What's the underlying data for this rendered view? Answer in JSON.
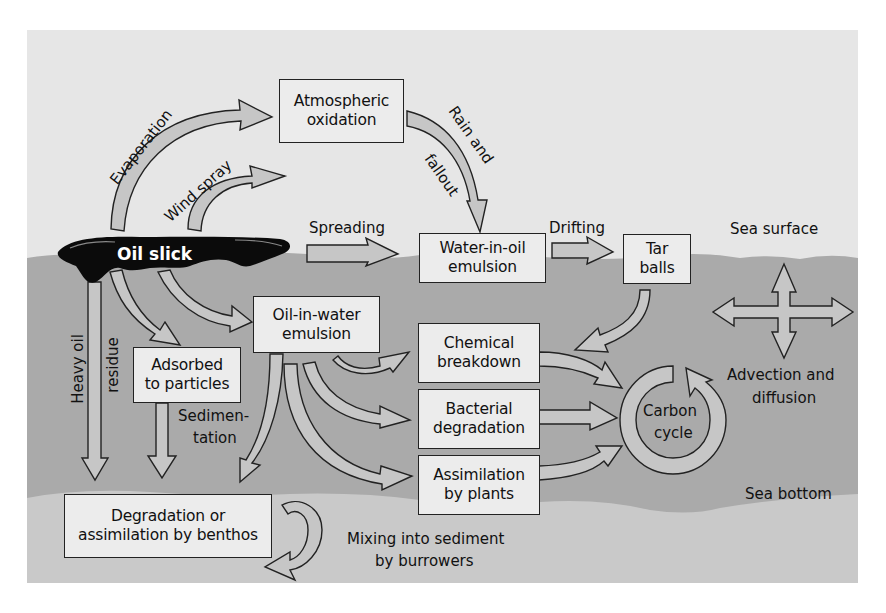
{
  "diagram": {
    "type": "process-flow",
    "colors": {
      "page_bg": "#ffffff",
      "sky": "#e6e6e6",
      "water": "#a9a9a9",
      "sediment": "#c9c9c9",
      "box_fill": "#ececec",
      "arrow_fill": "#c6c6c6",
      "outline": "#222222",
      "slick": "#0a0a0a"
    },
    "oil_slick": {
      "label": "Oil slick"
    },
    "zones": {
      "sea_surface": "Sea surface",
      "sea_bottom": "Sea bottom"
    },
    "boxes": {
      "atmospheric_oxidation": [
        "Atmospheric",
        "oxidation"
      ],
      "water_in_oil": [
        "Water-in-oil",
        "emulsion"
      ],
      "tar_balls": [
        "Tar",
        "balls"
      ],
      "oil_in_water": [
        "Oil-in-water",
        "emulsion"
      ],
      "adsorbed": [
        "Adsorbed",
        "to particles"
      ],
      "chemical": [
        "Chemical",
        "breakdown"
      ],
      "bacterial": [
        "Bacterial",
        "degradation"
      ],
      "assimilation_plants": [
        "Assimilation",
        "by plants"
      ],
      "benthos": [
        "Degradation or",
        "assimilation by benthos"
      ]
    },
    "process_labels": {
      "evaporation": "Evaporation",
      "wind_spray": "Wind spray",
      "rain_fallout_1": "Rain and",
      "rain_fallout_2": "fallout",
      "spreading": "Spreading",
      "drifting": "Drifting",
      "heavy_oil": "Heavy oil",
      "residue": "residue",
      "sedimentation_1": "Sedimen-",
      "sedimentation_2": "tation",
      "carbon_cycle_1": "Carbon",
      "carbon_cycle_2": "cycle",
      "advection_1": "Advection and",
      "advection_2": "diffusion",
      "mixing_1": "Mixing into sediment",
      "mixing_2": "by burrowers"
    },
    "flows": [
      {
        "from": "Oil slick",
        "to": "Atmospheric oxidation",
        "via": "Evaporation"
      },
      {
        "from": "Oil slick",
        "to": "air",
        "via": "Wind spray"
      },
      {
        "from": "Atmospheric oxidation",
        "to": "Water-in-oil emulsion",
        "via": "Rain and fallout"
      },
      {
        "from": "Oil slick",
        "to": "Water-in-oil emulsion",
        "via": "Spreading"
      },
      {
        "from": "Water-in-oil emulsion",
        "to": "Tar balls",
        "via": "Drifting"
      },
      {
        "from": "Tar balls",
        "to": "Chemical breakdown"
      },
      {
        "from": "Oil slick",
        "to": "Oil-in-water emulsion"
      },
      {
        "from": "Oil slick",
        "to": "Adsorbed to particles"
      },
      {
        "from": "Oil slick",
        "to": "Degradation or assimilation by benthos",
        "via": "Heavy oil residue"
      },
      {
        "from": "Adsorbed to particles",
        "to": "Degradation or assimilation by benthos",
        "via": "Sedimentation"
      },
      {
        "from": "Oil-in-water emulsion",
        "to": "Degradation or assimilation by benthos"
      },
      {
        "from": "Oil-in-water emulsion",
        "to": "Chemical breakdown"
      },
      {
        "from": "Oil-in-water emulsion",
        "to": "Bacterial degradation"
      },
      {
        "from": "Oil-in-water emulsion",
        "to": "Assimilation by plants"
      },
      {
        "from": "Chemical breakdown",
        "to": "Carbon cycle"
      },
      {
        "from": "Bacterial degradation",
        "to": "Carbon cycle"
      },
      {
        "from": "Assimilation by plants",
        "to": "Carbon cycle"
      },
      {
        "from": "Degradation or assimilation by benthos",
        "to": "sediment",
        "via": "Mixing into sediment by burrowers"
      }
    ]
  }
}
